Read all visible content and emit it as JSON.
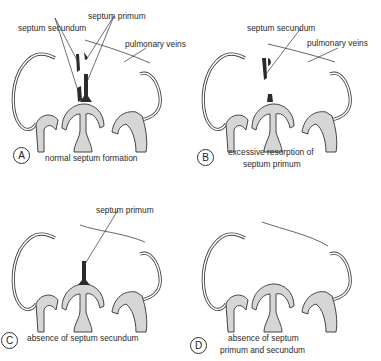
{
  "figure": {
    "colors": {
      "stroke": "#444444",
      "tissue_fill": "#d6d6d6",
      "septum_fill": "#2b2b2b",
      "background": "#ffffff"
    },
    "panels": [
      {
        "id": "A",
        "badge": "A",
        "caption": "normal septum formation",
        "labels": {
          "septum_secundum": "septum secundum",
          "septum_primum": "septum primum",
          "pulmonary_veins": "pulmonary veins"
        }
      },
      {
        "id": "B",
        "badge": "B",
        "caption_line1": "excessive resorption of",
        "caption_line2": "septum primum",
        "labels": {
          "septum_secundum": "septum secundum",
          "pulmonary_veins": "pulmonary veins"
        }
      },
      {
        "id": "C",
        "badge": "C",
        "caption": "absence of septum secundum",
        "labels": {
          "septum_primum": "septum primum"
        }
      },
      {
        "id": "D",
        "badge": "D",
        "caption_line1": "absence of septum",
        "caption_line2": "primum and secundum",
        "labels": {}
      }
    ]
  }
}
